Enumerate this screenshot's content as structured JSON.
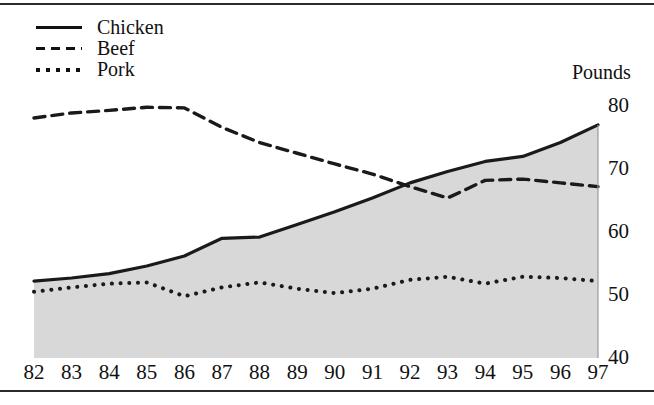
{
  "chart_data": {
    "type": "line",
    "title": "",
    "subtitle": "",
    "xlabel": "",
    "ylabel": "Pounds",
    "unit_label": "Pounds",
    "categories": [
      "82",
      "83",
      "84",
      "85",
      "86",
      "87",
      "88",
      "89",
      "90",
      "91",
      "92",
      "93",
      "94",
      "95",
      "96",
      "97"
    ],
    "x": [
      82,
      83,
      84,
      85,
      86,
      87,
      88,
      89,
      90,
      91,
      92,
      93,
      94,
      95,
      96,
      97
    ],
    "xlim": [
      82,
      97
    ],
    "ylim": [
      40,
      80
    ],
    "yticks": [
      40,
      50,
      60,
      70,
      80
    ],
    "xticks": [
      "82",
      "83",
      "84",
      "85",
      "86",
      "87",
      "88",
      "89",
      "90",
      "91",
      "92",
      "93",
      "94",
      "95",
      "96",
      "97"
    ],
    "grid": false,
    "legend_position": "top-left",
    "area_fill_series": "Chicken",
    "area_fill_color": "#d8d8d8",
    "series": [
      {
        "name": "Chicken",
        "style": "solid",
        "color": "#1a1a1a",
        "values": [
          52.2,
          52.7,
          53.4,
          54.6,
          56.2,
          59.0,
          59.2,
          61.2,
          63.2,
          65.4,
          67.8,
          69.6,
          71.2,
          72.0,
          74.2,
          77.0
        ]
      },
      {
        "name": "Beef",
        "style": "dashed",
        "color": "#1a1a1a",
        "values": [
          78.1,
          78.9,
          79.3,
          79.8,
          79.7,
          76.6,
          74.2,
          72.5,
          70.8,
          69.2,
          67.2,
          65.4,
          68.2,
          68.4,
          67.8,
          67.2
        ]
      },
      {
        "name": "Pork",
        "style": "dotted",
        "color": "#1a1a1a",
        "values": [
          50.5,
          51.2,
          51.8,
          52.0,
          49.8,
          51.2,
          52.0,
          51.0,
          50.3,
          51.0,
          52.4,
          52.9,
          51.8,
          52.9,
          52.7,
          52.2
        ]
      }
    ],
    "legend": [
      "Chicken",
      "Beef",
      "Pork"
    ]
  },
  "legend": {
    "items": [
      {
        "label": "Chicken",
        "key": "solid-line-key"
      },
      {
        "label": "Beef",
        "key": "dashed-line-key"
      },
      {
        "label": "Pork",
        "key": "dotted-line-key"
      }
    ]
  },
  "axis": {
    "unit_label": "Pounds"
  }
}
